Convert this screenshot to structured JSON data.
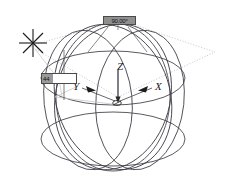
{
  "diagram": {
    "background_color": "#ffffff",
    "line_color": "#3c3c45",
    "construction_color": "#b9b9b9",
    "dimension_color": "#4a4a4a",
    "axes": {
      "z_label": "Z",
      "y_label": "Y",
      "x_label": "X"
    },
    "dimensions": {
      "angle": {
        "value": "90.00°",
        "kind": "angular-dimension"
      },
      "radius": {
        "value": "44",
        "kind": "linear-dimension"
      }
    },
    "markers": {
      "origin": "origin-point",
      "snap": "snap-crosshair"
    },
    "geometry": {
      "circle_count": 5,
      "reference_plane": "dotted-parallelogram"
    }
  }
}
